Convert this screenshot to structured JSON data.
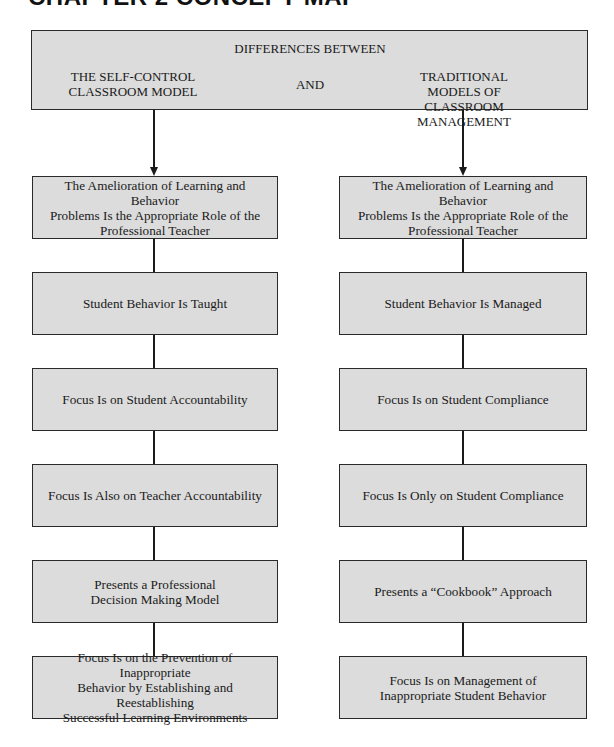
{
  "page": {
    "chapter_heading": "CHAPTER 2  CONCEPT MAP"
  },
  "header": {
    "title": "DIFFERENCES BETWEEN",
    "left_label": "THE SELF-CONTROL\nCLASSROOM MODEL",
    "connector": "AND",
    "right_label": "TRADITIONAL MODELS OF\nCLASSROOM MANAGEMENT"
  },
  "left_column": {
    "items": [
      {
        "label": "The Amelioration of Learning and Behavior\nProblems Is the Appropriate Role of the\nProfessional Teacher"
      },
      {
        "label": "Student Behavior Is Taught"
      },
      {
        "label": "Focus Is on Student Accountability"
      },
      {
        "label": "Focus Is Also on Teacher Accountability"
      },
      {
        "label": "Presents a Professional\nDecision Making Model"
      },
      {
        "label": "Focus Is on the Prevention of Inappropriate\nBehavior by Establishing and Reestablishing\nSuccessful Learning Environments"
      }
    ]
  },
  "right_column": {
    "items": [
      {
        "label": "The Amelioration of Learning and Behavior\nProblems Is the Appropriate Role of the\nProfessional Teacher"
      },
      {
        "label": "Student Behavior Is Managed"
      },
      {
        "label": "Focus Is on Student Compliance"
      },
      {
        "label": "Focus Is Only on Student Compliance"
      },
      {
        "label": "Presents a “Cookbook” Approach"
      },
      {
        "label": "Focus Is on Management of\nInappropriate Student Behavior"
      }
    ]
  },
  "colors": {
    "box_fill": "#dcdcdc",
    "box_border": "#2a2a2a",
    "connector_line": "#1a1a1a"
  }
}
